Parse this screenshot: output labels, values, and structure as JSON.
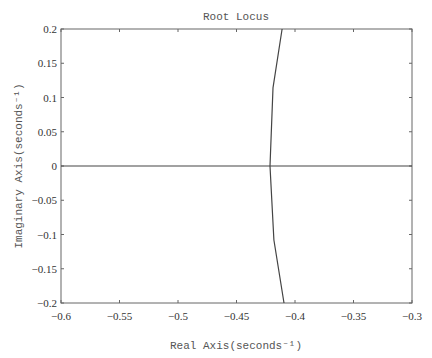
{
  "chart_data": {
    "type": "line",
    "title": "Root Locus",
    "xlabel": "Real Axis(seconds⁻¹)",
    "ylabel": "Imaginary Axis(seconds⁻¹)",
    "xlim": [
      -0.6,
      -0.3
    ],
    "ylim": [
      -0.2,
      0.2
    ],
    "xticks": [
      -0.6,
      -0.55,
      -0.5,
      -0.45,
      -0.4,
      -0.35,
      -0.3
    ],
    "yticks": [
      0.2,
      0.15,
      0.1,
      0.05,
      0,
      -0.05,
      -0.1,
      -0.15,
      -0.2
    ],
    "xtick_labels": [
      "-0.6",
      "-0.55",
      "-0.5",
      "-0.45",
      "-0.4",
      "-0.35",
      "-0.3"
    ],
    "ytick_labels": [
      "0.2",
      "0.15",
      "0.1",
      "0.05",
      "0",
      "-0.05",
      "-0.1",
      "-0.15",
      "-0.2"
    ],
    "grid": false,
    "legend": null,
    "series": [
      {
        "name": "real-axis-branch",
        "x": [
          -0.6,
          -0.3
        ],
        "y": [
          0.0,
          0.0
        ]
      },
      {
        "name": "upper-branch",
        "x": [
          -0.4214,
          -0.4188,
          -0.411
        ],
        "y": [
          0.0,
          0.114,
          0.2
        ]
      },
      {
        "name": "lower-branch",
        "x": [
          -0.4214,
          -0.418,
          -0.4094
        ],
        "y": [
          0.0,
          -0.108,
          -0.2
        ]
      }
    ]
  }
}
